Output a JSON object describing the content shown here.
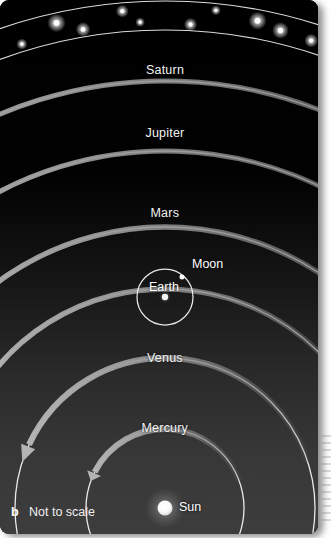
{
  "figure": {
    "panel_letter": "b",
    "scale_note": "Not to scale",
    "caption_hint": "",
    "background_top_color": "#000000",
    "background_bottom_color": "#3a3a3a",
    "orbit_line_color": "#f2f2f2",
    "arrow_color": "#9a9a9a",
    "label_color": "#f2f2f2"
  },
  "chart_data": {
    "type": "diagram",
    "subtitle": "Not to scale",
    "center_body": "Sun",
    "sun": {
      "cx": 165,
      "cy": 508,
      "r": 7.5,
      "color": "#ffffff"
    },
    "orbits": [
      {
        "name": "Mercury",
        "radius": 79,
        "label_x": 165,
        "label_y": 428,
        "arrow_direction": "counterclockwise",
        "arrow_start_deg": 20,
        "arrow_end_deg": 160
      },
      {
        "name": "Venus",
        "radius": 150,
        "label_x": 165,
        "label_y": 358,
        "arrow_direction": "counterclockwise",
        "arrow_start_deg": 18,
        "arrow_end_deg": 162
      },
      {
        "name": "Earth",
        "radius": 219,
        "label_x": 165,
        "label_y": 282,
        "arrow_direction": "counterclockwise",
        "arrow_start_deg": 15,
        "arrow_end_deg": 165
      },
      {
        "name": "Mars",
        "radius": 281,
        "label_x": 165,
        "label_y": 213,
        "arrow_direction": "counterclockwise",
        "arrow_start_deg": 12,
        "arrow_end_deg": 168
      },
      {
        "name": "Jupiter",
        "radius": 357,
        "label_x": 165,
        "label_y": 133,
        "arrow_direction": "counterclockwise",
        "arrow_start_deg": 10,
        "arrow_end_deg": 170
      },
      {
        "name": "Saturn",
        "radius": 427,
        "label_x": 165,
        "label_y": 70,
        "arrow_direction": "counterclockwise",
        "arrow_start_deg": 9,
        "arrow_end_deg": 171
      }
    ],
    "asteroid_belt": {
      "name": "asteroid-belt",
      "inner_radius": 478,
      "outer_radius": 507,
      "star_count": 44,
      "star_color": "#ffffff"
    },
    "earth_system": {
      "planet_label": "Earth",
      "planet_label_x": 164,
      "planet_label_y": 287,
      "planet_dot_x": 165,
      "planet_dot_y": 297,
      "moon_orbit_radius": 28,
      "moon_label": "Moon",
      "moon_label_x": 207,
      "moon_label_y": 264,
      "moon_dot_x": 182,
      "moon_dot_y": 277
    },
    "labels": [
      "Saturn",
      "Jupiter",
      "Mars",
      "Earth",
      "Moon",
      "Venus",
      "Mercury",
      "Sun"
    ],
    "annotations": [
      "b",
      "Not to scale"
    ]
  }
}
